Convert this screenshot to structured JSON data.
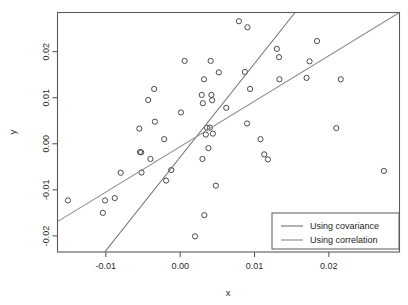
{
  "chart_data": {
    "type": "scatter",
    "title": "",
    "xlabel": "x",
    "ylabel": "y",
    "grid": false,
    "xlim": [
      -0.0165,
      0.0295
    ],
    "ylim": [
      -0.0235,
      0.0285
    ],
    "xticks": [
      -0.01,
      0.0,
      0.01,
      0.02
    ],
    "xticklabels": [
      "-0.01",
      "0.00",
      "0.01",
      "0.02"
    ],
    "yticks": [
      0.02,
      0.01,
      0.0,
      -0.01,
      -0.02
    ],
    "yticklabels": [
      "0.02",
      "0.01",
      "0.00",
      "-0.01",
      "-0.02"
    ],
    "points": [
      [
        -0.0151,
        -0.0123
      ],
      [
        -0.0101,
        -0.0123
      ],
      [
        -0.0104,
        -0.015
      ],
      [
        -0.0088,
        -0.0118
      ],
      [
        -0.008,
        -0.0063
      ],
      [
        -0.0055,
        0.0033
      ],
      [
        -0.0054,
        -0.0018
      ],
      [
        -0.00525,
        -0.00185
      ],
      [
        -0.0052,
        -0.00625
      ],
      [
        -0.0043,
        0.0095
      ],
      [
        -0.004,
        -0.0033
      ],
      [
        -0.0035,
        0.0119
      ],
      [
        -0.0034,
        0.0048
      ],
      [
        -0.00215,
        0.001
      ],
      [
        -0.0019,
        -0.008
      ],
      [
        -0.0012,
        -0.0057
      ],
      [
        0.0001,
        0.0068
      ],
      [
        0.0006,
        0.018
      ],
      [
        0.0029,
        0.0106
      ],
      [
        0.003,
        -0.0033
      ],
      [
        0.00305,
        0.0088
      ],
      [
        0.0032,
        0.014
      ],
      [
        0.00325,
        -0.0155
      ],
      [
        0.00345,
        0.002
      ],
      [
        0.0036,
        0.0035
      ],
      [
        0.0038,
        -0.00095
      ],
      [
        0.004,
        0.0035
      ],
      [
        0.0041,
        0.018
      ],
      [
        0.0042,
        0.0106
      ],
      [
        0.0043,
        0.00945
      ],
      [
        0.0044,
        0.0022
      ],
      [
        0.0048,
        -0.0091
      ],
      [
        0.0052,
        0.0155
      ],
      [
        0.002,
        -0.0201
      ],
      [
        0.0062,
        0.0078
      ],
      [
        0.0079,
        0.0266
      ],
      [
        0.0087,
        0.0156
      ],
      [
        0.009,
        0.0044
      ],
      [
        0.00905,
        0.0253
      ],
      [
        0.0094,
        0.0119
      ],
      [
        0.0108,
        0.001
      ],
      [
        0.0113,
        -0.0023
      ],
      [
        0.0118,
        -0.0034
      ],
      [
        0.013,
        0.0206
      ],
      [
        0.0133,
        0.0188
      ],
      [
        0.01335,
        0.014
      ],
      [
        0.017,
        0.0143
      ],
      [
        0.0174,
        0.0179
      ],
      [
        0.0184,
        0.0223
      ],
      [
        0.021,
        0.0034
      ],
      [
        0.0216,
        0.014
      ],
      [
        0.0274,
        -0.0059
      ]
    ],
    "lines": [
      {
        "name": "Using covariance",
        "x0": -0.01015,
        "y0": -0.0235,
        "x1": 0.01545,
        "y1": 0.0285,
        "color": "#707070"
      },
      {
        "name": "Using correlation",
        "x0": -0.0165,
        "y0": -0.0169,
        "x1": 0.0295,
        "y1": 0.0285,
        "color": "#8c8c8c"
      }
    ],
    "legend": {
      "position": "bottom-right",
      "entries": [
        {
          "label": "Using covariance",
          "color": "#707070"
        },
        {
          "label": "Using correlation",
          "color": "#8c8c8c"
        }
      ]
    }
  },
  "colors": {
    "background": "#ffffff",
    "axis": "#5a5a5a",
    "point": "#4a4a4a",
    "text": "#2b2b2b"
  }
}
